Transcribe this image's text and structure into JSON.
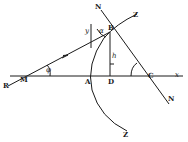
{
  "diagram": {
    "labels": {
      "R": "R",
      "M": "M",
      "A": "A",
      "D": "D",
      "C": "C",
      "x": "x",
      "B": "B",
      "N_top": "N",
      "N_bottom": "N",
      "Z_top": "Z",
      "Z_bottom": "Z",
      "y": "y",
      "h": "h",
      "alpha": "α",
      "phi": "φ"
    },
    "colors": {
      "ink": "#1a1a1a",
      "background": "#ffffff"
    }
  }
}
